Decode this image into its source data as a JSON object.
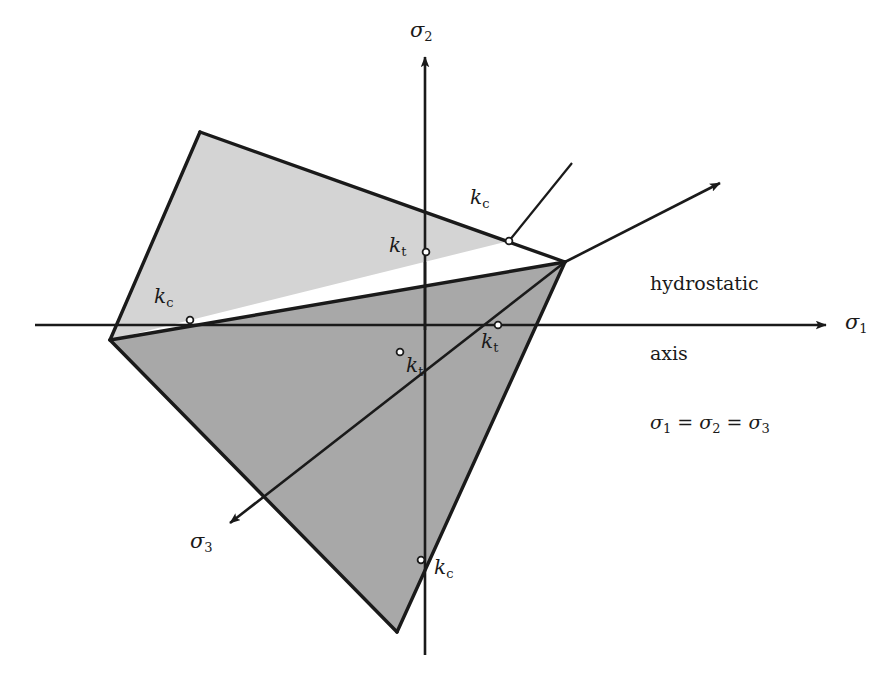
{
  "figure": {
    "background_color": "#ffffff",
    "line_color": "#1a1a1a",
    "fill_light": "#d4d4d4",
    "fill_dark": "#a8a8a8"
  },
  "axes": [
    {
      "id": "sigma1",
      "label": "σ",
      "subscript": "1",
      "label_x": 848,
      "label_y": 313,
      "arrow": {
        "x1": 35,
        "y1": 325,
        "x2": 828,
        "y2": 325
      },
      "arrow_head": true
    },
    {
      "id": "sigma2",
      "label": "σ",
      "subscript": "2",
      "label_x": 409,
      "label_y": 22,
      "arrow": {
        "x1": 425,
        "y1": 655,
        "x2": 425,
        "y2": 55
      },
      "arrow_head": true
    },
    {
      "id": "sigma3",
      "label": "σ",
      "subscript": "3",
      "label_x": 190,
      "label_y": 530,
      "arrow": {
        "x1": 565,
        "y1": 262,
        "x2": 228,
        "y2": 525
      },
      "arrow_head": true
    },
    {
      "id": "hydrostatic",
      "label": "hydrostatic axis",
      "arrow": {
        "x1": 565,
        "y1": 262,
        "x2": 722,
        "y2": 182
      },
      "arrow_head": true
    }
  ],
  "hydrostatic_note": {
    "line1": "hydrostatic",
    "line2": "axis",
    "eq_sigma": "σ",
    "eq_sub1": "1",
    "eq_sub2": "2",
    "eq_sub3": "3",
    "eq_sign": " = ",
    "x": 650,
    "y": 228
  },
  "markers": [
    {
      "id": "kc-sigma2-top",
      "letter": "k",
      "subscript": "c",
      "point_x": 509,
      "point_y": 241,
      "label_x": 470,
      "label_y": 188
    },
    {
      "id": "kt-sigma2",
      "letter": "k",
      "subscript": "t",
      "point_x": 426,
      "point_y": 252,
      "label_x": 389,
      "label_y": 236
    },
    {
      "id": "kc-sigma1-left",
      "letter": "k",
      "subscript": "c",
      "point_x": 190,
      "point_y": 320,
      "label_x": 153,
      "label_y": 287
    },
    {
      "id": "kt-sigma1",
      "letter": "k",
      "subscript": "t",
      "point_x": 498,
      "point_y": 325,
      "label_x": 481,
      "label_y": 331
    },
    {
      "id": "kt-sigma3",
      "letter": "k",
      "subscript": "t",
      "point_x": 400,
      "point_y": 352,
      "label_x": 406,
      "label_y": 356
    },
    {
      "id": "kc-sigma2-bottom",
      "letter": "k",
      "subscript": "c",
      "point_x": 421,
      "point_y": 560,
      "label_x": 434,
      "label_y": 558
    }
  ],
  "leader_lines": [
    {
      "id": "kc-top-leader",
      "x1": 509,
      "y1": 241,
      "x2": 572,
      "y2": 163
    },
    {
      "id": "kt-sigma3-leader",
      "x1": 400,
      "y1": 352,
      "x2": 306,
      "y2": 424
    }
  ],
  "surfaces": [
    {
      "id": "upper-light-face",
      "fill": "#d4d4d4",
      "points": "200,132 565,262 509,241 110,340"
    },
    {
      "id": "left-light-face",
      "fill": "#d4d4d4",
      "points": "200,132 110,340 110,340 200,132"
    },
    {
      "id": "lower-dark-face",
      "fill": "#a8a8a8",
      "points": "565,262 397,632 110,340"
    }
  ],
  "edges": [
    {
      "id": "edge-top-left",
      "x1": 200,
      "y1": 132,
      "x2": 565,
      "y2": 262
    },
    {
      "id": "edge-left-upper",
      "x1": 200,
      "y1": 132,
      "x2": 110,
      "y2": 340
    },
    {
      "id": "edge-ridge",
      "x1": 110,
      "y1": 340,
      "x2": 565,
      "y2": 262
    },
    {
      "id": "edge-right-lower",
      "x1": 565,
      "y1": 262,
      "x2": 397,
      "y2": 632
    },
    {
      "id": "edge-left-lower",
      "x1": 110,
      "y1": 340,
      "x2": 397,
      "y2": 632
    }
  ]
}
